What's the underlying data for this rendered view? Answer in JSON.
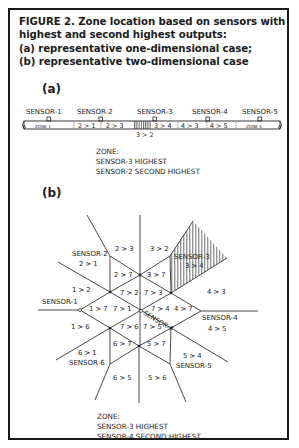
{
  "figure": {
    "caption_lines": [
      "FIGURE 2. Zone location based on sensors with",
      "highest and second highest outputs:",
      "(a) representative one-dimensional case;",
      "(b) representative two-dimensional case"
    ]
  },
  "panel_a": {
    "label": "(a)",
    "sensors": [
      "SENSOR-1",
      "SENSOR-2",
      "SENSOR-3",
      "SENSOR-4",
      "SENSOR-5"
    ],
    "zones": [
      "ZONE 1",
      "2 > 1",
      "2 > 3",
      "3 > 4",
      "4 > 3",
      "4 > 5",
      "ZONE 5"
    ],
    "hatched_zone_label": "3 > 2",
    "zone_note": [
      "ZONE:",
      "SENSOR-3 HIGHEST",
      "SENSOR-2 SECOND HIGHEST"
    ]
  },
  "panel_b": {
    "label": "(b)",
    "sensors": {
      "s1": "SENSOR-1",
      "s2": "SENSOR-2",
      "s3": "SENSOR-3",
      "s4": "SENSOR-4",
      "s5": "SENSOR-5",
      "s6": "SENSOR-6",
      "s7": "SENSOR-7"
    },
    "regions": {
      "r23": "2 > 3",
      "r32": "3 > 2",
      "r21": "2 > 1",
      "r34": "3 > 4",
      "r27": "2 > 7",
      "r37": "3 > 7",
      "r12": "1 > 2",
      "r72": "7 > 2",
      "r73": "7 > 3",
      "r43": "4 > 3",
      "r17": "1 > 7",
      "r71": "7 > 1",
      "r74": "7 > 4",
      "r47": "4 > 7",
      "r16": "1 > 6",
      "r76": "7 > 6",
      "r75": "7 > 5",
      "r45": "4 > 5",
      "r61": "6 > 1",
      "r67": "6 > 7",
      "r57": "5 > 7",
      "r54": "5 > 4",
      "r65": "6 > 5",
      "r56": "5 > 6"
    },
    "zone_note": [
      "ZONE:",
      "SENSOR-3 HIGHEST",
      "SENSOR-4 SECOND HIGHEST"
    ]
  }
}
